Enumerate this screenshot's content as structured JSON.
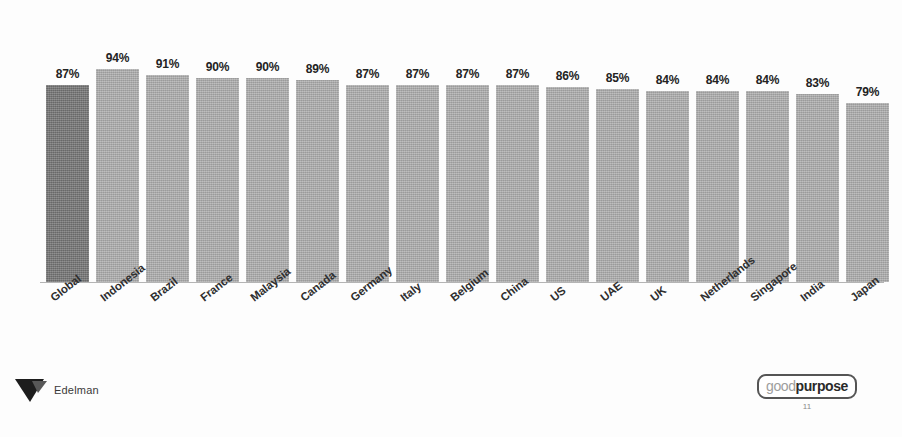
{
  "chart_data": {
    "type": "bar",
    "title": "",
    "subtitle": "",
    "xlabel": "",
    "ylabel": "",
    "ylim": [
      0,
      100
    ],
    "grid": false,
    "legend": "none",
    "value_suffix": "%",
    "categories": [
      "Global",
      "Indonesia",
      "Brazil",
      "France",
      "Malaysia",
      "Canada",
      "Germany",
      "Italy",
      "Belgium",
      "China",
      "US",
      "UAE",
      "UK",
      "Netherlands",
      "Singapore",
      "India",
      "Japan"
    ],
    "values": [
      87,
      94,
      91,
      90,
      90,
      89,
      87,
      87,
      87,
      87,
      86,
      85,
      84,
      84,
      84,
      83,
      79
    ],
    "value_labels": [
      "87%",
      "94%",
      "91%",
      "90%",
      "90%",
      "89%",
      "87%",
      "87%",
      "87%",
      "87%",
      "86%",
      "85%",
      "84%",
      "84%",
      "84%",
      "83%",
      "79%"
    ],
    "highlight_index": 0,
    "colors": {
      "bar": "#a9a9a9",
      "bar_highlight": "#777777",
      "label_text": "#232323",
      "category_text": "#2e2e2e",
      "baseline": "#b4b4b4",
      "background": "#fdfdfd"
    }
  },
  "footer": {
    "brand_name": "Edelman",
    "brand_mark_icon": "edelman-arrow-icon",
    "badge": {
      "good_text": "good",
      "purpose_text": "purpose"
    },
    "page_number": "11"
  }
}
